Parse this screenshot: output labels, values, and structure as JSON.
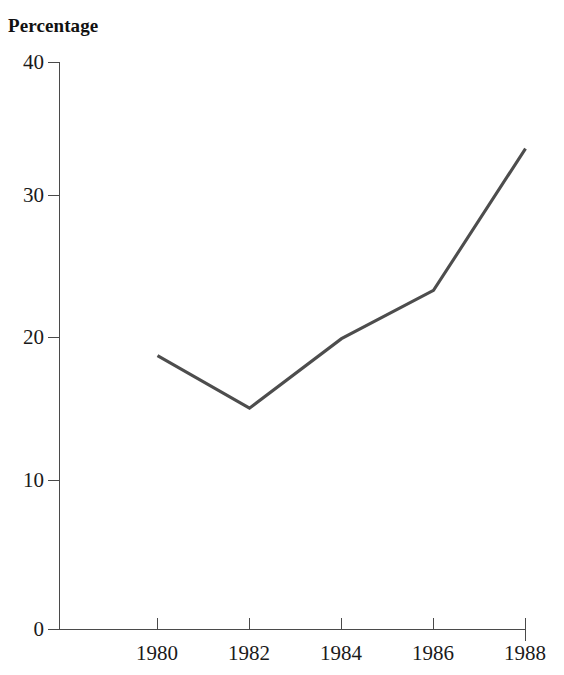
{
  "chart_data": {
    "type": "line",
    "title": "Percentage",
    "xlabel": "",
    "ylabel": "",
    "x": [
      1980,
      1982,
      1984,
      1986,
      1988
    ],
    "values": [
      19.3,
      15.6,
      20.5,
      23.9,
      33.9
    ],
    "categories": [
      "1980",
      "1982",
      "1984",
      "1986",
      "1988"
    ],
    "xtick_labels": [
      "1980",
      "1982",
      "1984",
      "1986",
      "1988"
    ],
    "ytick_labels": [
      "0",
      "10",
      "20",
      "30",
      "40"
    ],
    "yticks": [
      0,
      10,
      20,
      30,
      40
    ],
    "ylim": [
      0,
      40
    ],
    "xlim": [
      1980,
      1988
    ],
    "grid": false,
    "legend": null,
    "series": [
      {
        "name": "Percentage",
        "values": [
          19.3,
          15.6,
          20.5,
          23.9,
          33.9
        ],
        "color": "#4d4d4d"
      }
    ],
    "colors": {
      "line": "#4d4d4d",
      "axis": "#4a4a4a",
      "text": "#1a1a1a",
      "background": "#ffffff"
    }
  },
  "axis": {
    "y_labels": [
      "40",
      "30",
      "20",
      "10",
      "0"
    ],
    "x_labels": [
      "1980",
      "1982",
      "1984",
      "1986",
      "1988"
    ]
  }
}
